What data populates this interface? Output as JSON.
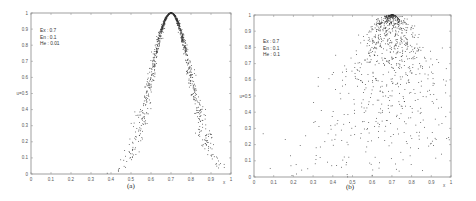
{
  "figure": {
    "panels": [
      {
        "caption": "(a)",
        "legend": [
          "Ex : 0.7",
          "En : 0.1",
          "He : 0.01"
        ],
        "ylabel": "u",
        "xlabel": "x"
      },
      {
        "caption": "(b)",
        "legend": [
          "Ex : 0.7",
          "En : 0.1",
          "He : 0.1"
        ],
        "ylabel": "u",
        "xlabel": "x"
      }
    ],
    "xticks": [
      "0",
      "0.1",
      "0.2",
      "0.3",
      "0.4",
      "0.5",
      "0.6",
      "0.7",
      "0.8",
      "0.9",
      "1"
    ],
    "yticks": [
      "0",
      "0.1",
      "0.2",
      "0.3",
      "0.4",
      "0.5",
      "0.6",
      "0.7",
      "0.8",
      "0.9",
      "1"
    ],
    "colors": {
      "axis": "#888888",
      "points": "#333333",
      "text": "#444444"
    }
  },
  "chart_data": [
    {
      "type": "scatter",
      "title": "(a)",
      "description": "Normal cloud model drops, membership u = exp(-(x-Ex)^2 / (2 En'^2)), En' ~ N(En, He^2)",
      "params": {
        "Ex": 0.7,
        "En": 0.1,
        "He": 0.01,
        "n_points": 1000
      },
      "legend": [
        "Ex : 0.7",
        "En : 0.1",
        "He : 0.01"
      ],
      "xlabel": "x",
      "ylabel": "u",
      "xlim": [
        0,
        1
      ],
      "ylim": [
        0,
        1
      ],
      "sample_points": [
        [
          0.35,
          0.01
        ],
        [
          0.45,
          0.05
        ],
        [
          0.5,
          0.15
        ],
        [
          0.55,
          0.3
        ],
        [
          0.6,
          0.6
        ],
        [
          0.65,
          0.88
        ],
        [
          0.7,
          1.0
        ],
        [
          0.75,
          0.88
        ],
        [
          0.8,
          0.6
        ],
        [
          0.85,
          0.32
        ],
        [
          0.9,
          0.13
        ],
        [
          0.95,
          0.05
        ]
      ]
    },
    {
      "type": "scatter",
      "title": "(b)",
      "description": "Normal cloud model drops with large hyper-entropy; points widely dispersed, dense near u=1 around x=0.7",
      "params": {
        "Ex": 0.7,
        "En": 0.1,
        "He": 0.1,
        "n_points": 1000
      },
      "legend": [
        "Ex : 0.7",
        "En : 0.1",
        "He : 0.1"
      ],
      "xlabel": "x",
      "ylabel": "u",
      "xlim": [
        0,
        1
      ],
      "ylim": [
        0,
        1
      ],
      "sample_points": [
        [
          0.05,
          0.38
        ],
        [
          0.1,
          0.15
        ],
        [
          0.2,
          0.6
        ],
        [
          0.3,
          0.7
        ],
        [
          0.4,
          0.5
        ],
        [
          0.5,
          0.85
        ],
        [
          0.6,
          0.95
        ],
        [
          0.7,
          1.0
        ],
        [
          0.8,
          0.9
        ],
        [
          0.9,
          0.6
        ],
        [
          0.98,
          0.3
        ]
      ]
    }
  ]
}
